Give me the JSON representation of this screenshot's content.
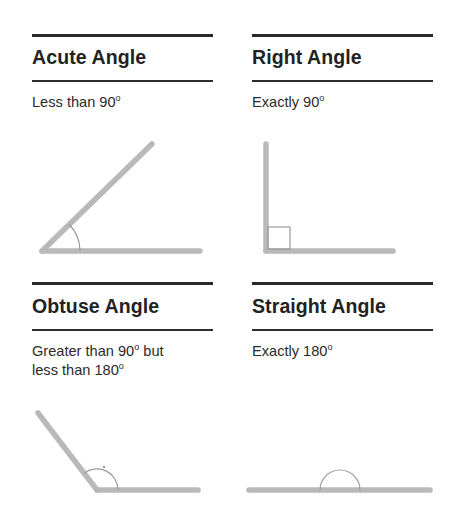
{
  "cards": [
    {
      "id": "acute",
      "title": "Acute Angle",
      "description_lines": [
        {
          "text": "Less than 90",
          "sup": "o"
        }
      ]
    },
    {
      "id": "right",
      "title": "Right Angle",
      "description_lines": [
        {
          "text": "Exactly 90",
          "sup": "o"
        }
      ]
    },
    {
      "id": "obtuse",
      "title": "Obtuse Angle",
      "description_lines": [
        {
          "text": "Greater than 90",
          "sup": "o",
          "tail": " but"
        },
        {
          "text": "less than 180",
          "sup": "o"
        }
      ]
    },
    {
      "id": "straight",
      "title": "Straight Angle",
      "description_lines": [
        {
          "text": "Exactly 180",
          "sup": "o"
        }
      ]
    }
  ],
  "colors": {
    "rule": "#2a2a2a",
    "ray": "#b9b9b9",
    "marker": "#9a9a9a",
    "text": "#222222"
  }
}
